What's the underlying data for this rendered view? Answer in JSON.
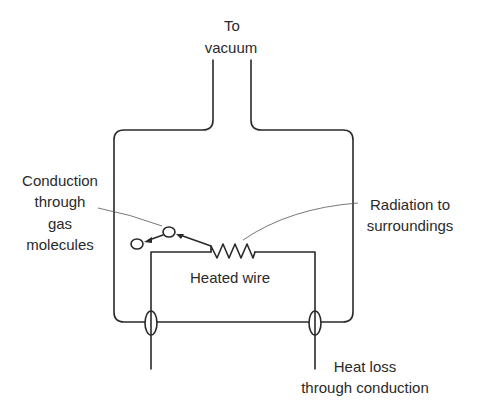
{
  "diagram": {
    "labels": {
      "vacuum_line1": "To",
      "vacuum_line2": "vacuum",
      "conduction_gas_line1": "Conduction",
      "conduction_gas_line2": "through",
      "conduction_gas_line3": "gas",
      "conduction_gas_line4": "molecules",
      "radiation_line1": "Radiation to",
      "radiation_line2": "surroundings",
      "heated_wire": "Heated wire",
      "heat_loss_line1": "Heat loss",
      "heat_loss_line2": "through conduction"
    },
    "colors": {
      "ink": "#2a2a2a",
      "background": "#ffffff"
    }
  }
}
